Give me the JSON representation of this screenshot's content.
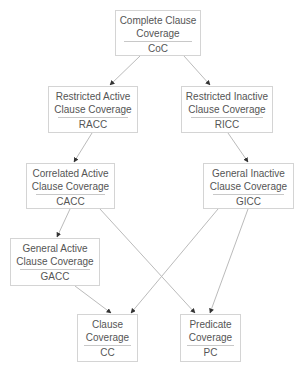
{
  "diagram": {
    "type": "subsumption-hierarchy",
    "colors": {
      "text": "#555555",
      "border": "#d4d4d4",
      "edge": "#bbbbbb",
      "arrowhead": "#333333"
    },
    "nodes": {
      "coc": {
        "line1": "Complete Clause",
        "line2": "Coverage",
        "abbr": "CoC"
      },
      "racc": {
        "line1": "Restricted Active",
        "line2": "Clause Coverage",
        "abbr": "RACC"
      },
      "ricc": {
        "line1": "Restricted Inactive",
        "line2": "Clause Coverage",
        "abbr": "RICC"
      },
      "cacc": {
        "line1": "Correlated Active",
        "line2": "Clause Coverage",
        "abbr": "CACC"
      },
      "gicc": {
        "line1": "General Inactive",
        "line2": "Clause Coverage",
        "abbr": "GICC"
      },
      "gacc": {
        "line1": "General Active",
        "line2": "Clause Coverage",
        "abbr": "GACC"
      },
      "cc": {
        "line1": "Clause",
        "line2": "Coverage",
        "abbr": "CC"
      },
      "pc": {
        "line1": "Predicate",
        "line2": "Coverage",
        "abbr": "PC"
      }
    },
    "edges": [
      {
        "from": "CoC",
        "to": "RACC"
      },
      {
        "from": "CoC",
        "to": "RICC"
      },
      {
        "from": "RACC",
        "to": "CACC"
      },
      {
        "from": "RICC",
        "to": "GICC"
      },
      {
        "from": "CACC",
        "to": "GACC"
      },
      {
        "from": "CACC",
        "to": "PC"
      },
      {
        "from": "GICC",
        "to": "CC"
      },
      {
        "from": "GICC",
        "to": "PC"
      },
      {
        "from": "GACC",
        "to": "CC"
      }
    ]
  }
}
